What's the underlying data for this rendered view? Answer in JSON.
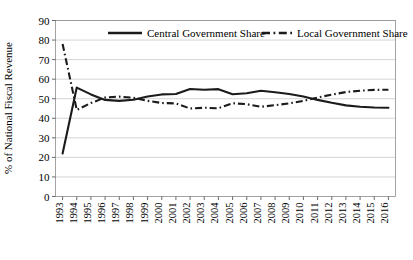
{
  "chart_data": {
    "type": "line",
    "title": "",
    "xlabel": "",
    "ylabel": "% of National Fiscal Revenue",
    "ylim": [
      0,
      90
    ],
    "ytick_step": 10,
    "grid": true,
    "legend_position": "top-inside",
    "x": [
      1993,
      1994,
      1995,
      1996,
      1997,
      1998,
      1999,
      2000,
      2001,
      2002,
      2003,
      2004,
      2005,
      2006,
      2007,
      2008,
      2009,
      2010,
      2011,
      2012,
      2013,
      2014,
      2015,
      2016
    ],
    "yticks": [
      0,
      10,
      20,
      30,
      40,
      50,
      60,
      70,
      80,
      90
    ],
    "ytick_labels": [
      "0",
      "10",
      "20",
      "30",
      "40",
      "50",
      "60",
      "70",
      "80",
      "90"
    ],
    "xtick_labels": [
      "1993",
      "1994",
      "1995",
      "1996",
      "1997",
      "1998",
      "1999",
      "2000",
      "2001",
      "2002",
      "2003",
      "2004",
      "2005",
      "2006",
      "2007",
      "2008",
      "2009",
      "2010",
      "2011",
      "2012",
      "2013",
      "2014",
      "2015",
      "2016"
    ],
    "series": [
      {
        "name": "Central Government Share",
        "style": "solid",
        "color": "#1b1b1b",
        "values": [
          22.0,
          55.7,
          52.2,
          49.4,
          48.9,
          49.5,
          51.1,
          52.2,
          52.4,
          55.0,
          54.6,
          54.9,
          52.3,
          52.8,
          54.1,
          53.3,
          52.4,
          51.1,
          49.4,
          47.9,
          46.6,
          45.9,
          45.5,
          45.4
        ]
      },
      {
        "name": "Local Government Share",
        "style": "dash-dot",
        "color": "#1b1b1b",
        "values": [
          78.0,
          44.3,
          47.8,
          50.6,
          51.1,
          50.5,
          48.9,
          47.8,
          47.6,
          45.0,
          45.4,
          45.1,
          47.7,
          47.2,
          45.9,
          46.7,
          47.6,
          48.9,
          50.6,
          52.1,
          53.4,
          54.1,
          54.5,
          54.6
        ]
      }
    ]
  },
  "legend": {
    "entries": [
      {
        "label": "Central Government Share",
        "style": "solid"
      },
      {
        "label": "Local Government Share",
        "style": "dash-dot"
      }
    ]
  }
}
